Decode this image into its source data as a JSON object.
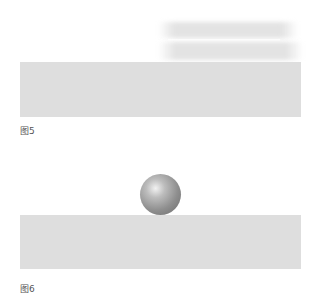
{
  "figures": [
    {
      "caption": "图5",
      "description": "motion-blurred object above gray slab"
    },
    {
      "caption": "图6",
      "description": "sphere resting on gray slab"
    }
  ],
  "colors": {
    "slab": "#dedede",
    "background": "#ffffff",
    "sphere": "#8e8e8e"
  }
}
